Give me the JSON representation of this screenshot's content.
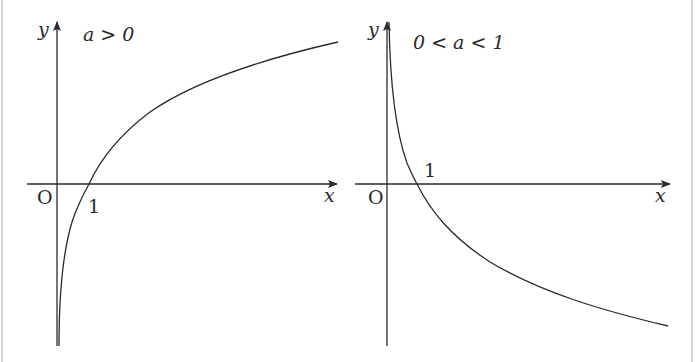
{
  "figure": {
    "panels": [
      {
        "id": "left",
        "condition": "a > 0",
        "y_label": "y",
        "x_label": "x",
        "origin_label": "O",
        "intercept_label": "1",
        "curve": "increasing logarithmic-type curve, vertical asymptote at y-axis, crosses x-axis at 1"
      },
      {
        "id": "right",
        "condition": "0 < a < 1",
        "y_label": "y",
        "x_label": "x",
        "origin_label": "O",
        "intercept_label": "1",
        "curve": "decreasing logarithmic-type curve, vertical asymptote at y-axis, crosses x-axis at 1"
      }
    ],
    "colors": {
      "ink": "#2a2a2a",
      "background": "#ffffff",
      "border": "#d6d6d6"
    }
  }
}
